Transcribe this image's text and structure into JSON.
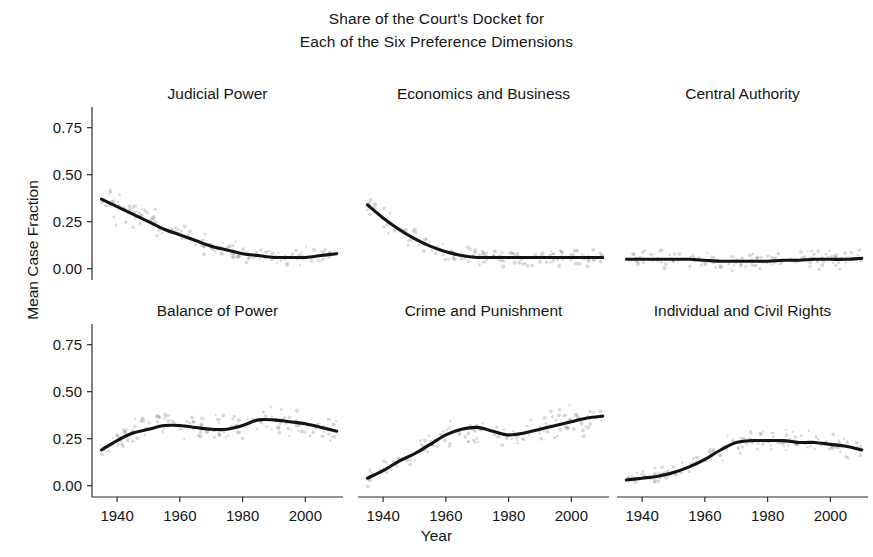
{
  "figure": {
    "title_line_1": "Share of the Court's Docket for",
    "title_line_2": "Each of the Six Preference Dimensions",
    "xlabel": "Year",
    "ylabel": "Mean Case Fraction",
    "background_color": "#ffffff",
    "line_color": "#141414",
    "point_color": "#8d8d8d"
  },
  "axes": {
    "ytick_labels": [
      "0.75",
      "0.50",
      "0.25",
      "0.00"
    ],
    "ytick_values": [
      0.75,
      0.5,
      0.25,
      0.0
    ],
    "xtick_labels": [
      "1940",
      "1960",
      "1980",
      "2000"
    ],
    "xtick_values": [
      1940,
      1960,
      1980,
      2000
    ],
    "xlim": [
      1932,
      2012
    ],
    "ylim": [
      -0.06,
      0.86
    ]
  },
  "chart_data": {
    "type": "line",
    "title": "Share of the Court's Docket for Each of the Six Preference Dimensions",
    "xlabel": "Year",
    "ylabel": "Mean Case Fraction",
    "xlim": [
      1932,
      2012
    ],
    "ylim": [
      -0.06,
      0.86
    ],
    "grid": false,
    "legend": "none",
    "layout": "3 columns x 2 rows of small-multiple panels, shared axes",
    "panels": [
      {
        "title": "Judicial Power",
        "row": 0,
        "col": 0,
        "x": [
          1935,
          1940,
          1945,
          1950,
          1955,
          1960,
          1965,
          1970,
          1975,
          1980,
          1985,
          1990,
          1995,
          2000,
          2005,
          2010
        ],
        "values": [
          0.37,
          0.33,
          0.29,
          0.25,
          0.21,
          0.18,
          0.15,
          0.12,
          0.1,
          0.08,
          0.07,
          0.06,
          0.06,
          0.06,
          0.07,
          0.08
        ]
      },
      {
        "title": "Economics and Business",
        "row": 0,
        "col": 1,
        "x": [
          1935,
          1940,
          1945,
          1950,
          1955,
          1960,
          1965,
          1970,
          1975,
          1980,
          1985,
          1990,
          1995,
          2000,
          2005,
          2010
        ],
        "values": [
          0.34,
          0.27,
          0.21,
          0.16,
          0.12,
          0.09,
          0.07,
          0.06,
          0.06,
          0.06,
          0.06,
          0.06,
          0.06,
          0.06,
          0.06,
          0.06
        ]
      },
      {
        "title": "Central Authority",
        "row": 0,
        "col": 2,
        "x": [
          1935,
          1940,
          1945,
          1950,
          1955,
          1960,
          1965,
          1970,
          1975,
          1980,
          1985,
          1990,
          1995,
          2000,
          2005,
          2010
        ],
        "values": [
          0.05,
          0.05,
          0.05,
          0.05,
          0.05,
          0.045,
          0.04,
          0.04,
          0.04,
          0.04,
          0.045,
          0.045,
          0.05,
          0.05,
          0.05,
          0.055
        ]
      },
      {
        "title": "Balance of Power",
        "row": 1,
        "col": 0,
        "x": [
          1935,
          1940,
          1945,
          1950,
          1955,
          1960,
          1965,
          1970,
          1975,
          1980,
          1985,
          1990,
          1995,
          2000,
          2005,
          2010
        ],
        "values": [
          0.19,
          0.24,
          0.28,
          0.3,
          0.32,
          0.32,
          0.31,
          0.3,
          0.3,
          0.32,
          0.35,
          0.35,
          0.34,
          0.33,
          0.31,
          0.29
        ]
      },
      {
        "title": "Crime and Punishment",
        "row": 1,
        "col": 1,
        "x": [
          1935,
          1940,
          1945,
          1950,
          1955,
          1960,
          1965,
          1970,
          1975,
          1980,
          1985,
          1990,
          1995,
          2000,
          2005,
          2010
        ],
        "values": [
          0.04,
          0.08,
          0.13,
          0.17,
          0.22,
          0.27,
          0.3,
          0.31,
          0.29,
          0.27,
          0.28,
          0.3,
          0.32,
          0.34,
          0.36,
          0.37
        ]
      },
      {
        "title": "Individual and Civil Rights",
        "row": 1,
        "col": 2,
        "x": [
          1935,
          1940,
          1945,
          1950,
          1955,
          1960,
          1965,
          1970,
          1975,
          1980,
          1985,
          1990,
          1995,
          2000,
          2005,
          2010
        ],
        "values": [
          0.03,
          0.04,
          0.05,
          0.07,
          0.1,
          0.14,
          0.19,
          0.23,
          0.24,
          0.24,
          0.24,
          0.23,
          0.23,
          0.22,
          0.21,
          0.19
        ]
      }
    ]
  }
}
